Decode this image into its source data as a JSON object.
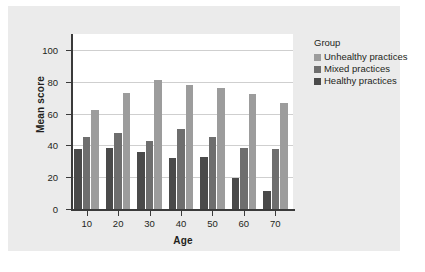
{
  "chart_data": {
    "type": "bar",
    "title": "",
    "xlabel": "Age",
    "ylabel": "Mean score",
    "categories": [
      "10",
      "20",
      "30",
      "40",
      "50",
      "60",
      "70"
    ],
    "xlim": [
      0,
      7
    ],
    "ylim": [
      0,
      110
    ],
    "yticks": [
      0,
      20,
      40,
      60,
      80,
      100
    ],
    "grid": true,
    "legend_title": "Group",
    "legend_position": "right",
    "series": [
      {
        "name": "Unhealthy practices",
        "color": "#9c9c9c",
        "values": [
          62.5,
          73,
          81,
          78,
          76,
          72,
          66.5
        ]
      },
      {
        "name": "Mixed practices",
        "color": "#6e6e6e",
        "values": [
          45,
          48,
          43,
          50,
          45,
          38.5,
          38
        ]
      },
      {
        "name": "Healthy practices",
        "color": "#4a4a4a",
        "values": [
          38,
          38.5,
          36,
          32,
          33,
          19.5,
          11.5
        ]
      }
    ],
    "draw_order": [
      "Healthy practices",
      "Mixed practices",
      "Unhealthy practices"
    ]
  },
  "colors": {
    "panel_background": "#ebebeb",
    "plot_background": "#ffffff",
    "axis": "#3a3a3a",
    "gridline": "#cfcfcf",
    "text": "#231f20"
  }
}
